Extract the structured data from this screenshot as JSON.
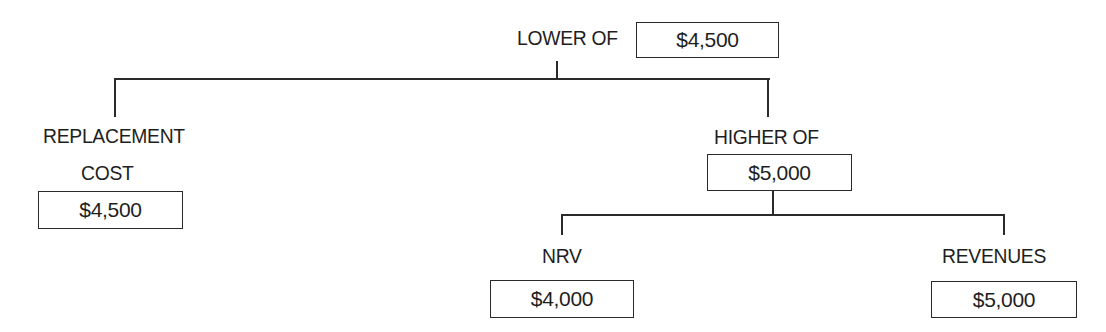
{
  "diagram": {
    "type": "tree",
    "root": {
      "label": "LOWER OF",
      "value": "$4,500"
    },
    "children": {
      "replacement_cost": {
        "label_line1": "REPLACEMENT",
        "label_line2": "COST",
        "value": "$4,500"
      },
      "higher_of": {
        "label": "HIGHER OF",
        "value": "$5,000",
        "children": {
          "nrv": {
            "label": "NRV",
            "value": "$4,000"
          },
          "revenues": {
            "label": "REVENUES",
            "value": "$5,000"
          }
        }
      }
    }
  }
}
